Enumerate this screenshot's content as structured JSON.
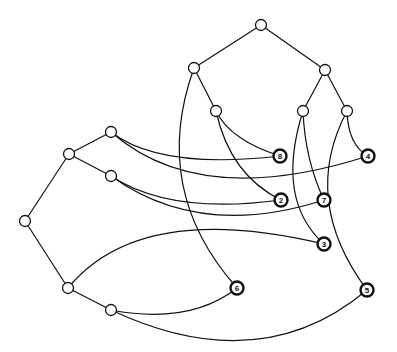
{
  "diagram": {
    "type": "graph",
    "leaf_labels": [
      "8",
      "4",
      "2",
      "7",
      "3",
      "6",
      "5"
    ],
    "nodes": {
      "t1": {
        "x": 261,
        "y": 25
      },
      "t2": {
        "x": 194,
        "y": 68
      },
      "t3": {
        "x": 325,
        "y": 70
      },
      "t4": {
        "x": 216,
        "y": 111
      },
      "t5": {
        "x": 303,
        "y": 111
      },
      "t6": {
        "x": 347,
        "y": 111
      },
      "l1": {
        "x": 111,
        "y": 132
      },
      "l2": {
        "x": 69,
        "y": 154
      },
      "l3": {
        "x": 111,
        "y": 176
      },
      "l4": {
        "x": 25,
        "y": 221
      },
      "l5": {
        "x": 68,
        "y": 288
      },
      "l6": {
        "x": 111,
        "y": 310
      },
      "n8": {
        "x": 280,
        "y": 156,
        "label": "8"
      },
      "n4": {
        "x": 368,
        "y": 156,
        "label": "4"
      },
      "n2": {
        "x": 281,
        "y": 200,
        "label": "2"
      },
      "n7": {
        "x": 324,
        "y": 200,
        "label": "7"
      },
      "n3": {
        "x": 324,
        "y": 244,
        "label": "3"
      },
      "n6": {
        "x": 237,
        "y": 288,
        "label": "6"
      },
      "n5": {
        "x": 367,
        "y": 290,
        "label": "5"
      }
    }
  }
}
